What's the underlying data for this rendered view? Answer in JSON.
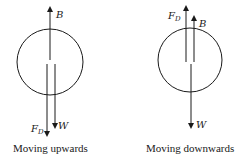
{
  "diagrams": [
    {
      "caption": "Moving upwards",
      "labels": {
        "buoyancy": "B",
        "drag_main": "F",
        "drag_sub": "D",
        "weight": "W"
      }
    },
    {
      "caption": "Moving downwards",
      "labels": {
        "buoyancy": "B",
        "drag_main": "F",
        "drag_sub": "D",
        "weight": "W"
      }
    }
  ],
  "colors": {
    "ink": "#1a1a1a",
    "background": "#ffffff"
  }
}
